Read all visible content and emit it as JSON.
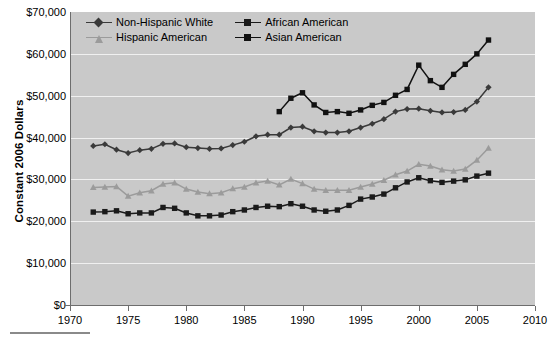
{
  "chart_data": {
    "type": "line",
    "title": "",
    "xlabel": "",
    "ylabel": "Constant 2006 Dollars",
    "xlim": [
      1970,
      2010
    ],
    "ylim": [
      0,
      70000
    ],
    "grid": true,
    "legend_position": "top-left-inside",
    "plot_background": "#c9c9c9",
    "gridline_color": "#f0f0f0",
    "xticks": [
      "1970",
      "1975",
      "1980",
      "1985",
      "1990",
      "1995",
      "2000",
      "2005",
      "2010"
    ],
    "xtick_values": [
      1970,
      1975,
      1980,
      1985,
      1990,
      1995,
      2000,
      2005,
      2010
    ],
    "yticks": [
      "$0",
      "$10,000",
      "$20,000",
      "$30,000",
      "$40,000",
      "$50,000",
      "$60,000",
      "$70,000"
    ],
    "ytick_values": [
      0,
      10000,
      20000,
      30000,
      40000,
      50000,
      60000,
      70000
    ],
    "series": [
      {
        "name": "Non-Hispanic White",
        "color": "#3a3a3a",
        "marker": "diamond",
        "x": [
          1972,
          1973,
          1974,
          1975,
          1976,
          1977,
          1978,
          1979,
          1980,
          1981,
          1982,
          1983,
          1984,
          1985,
          1986,
          1987,
          1988,
          1989,
          1990,
          1991,
          1992,
          1993,
          1994,
          1995,
          1996,
          1997,
          1998,
          1999,
          2000,
          2001,
          2002,
          2003,
          2004,
          2005,
          2006
        ],
        "values": [
          38000,
          38400,
          37100,
          36300,
          37000,
          37300,
          38500,
          38600,
          37700,
          37500,
          37300,
          37400,
          38200,
          39000,
          40300,
          40700,
          40700,
          42400,
          42600,
          41500,
          41200,
          41200,
          41500,
          42400,
          43300,
          44400,
          46200,
          46800,
          46900,
          46400,
          46000,
          46100,
          46600,
          48600,
          52000
        ]
      },
      {
        "name": "African American",
        "color": "#1a1a1a",
        "marker": "square",
        "x": [
          1972,
          1973,
          1974,
          1975,
          1976,
          1977,
          1978,
          1979,
          1980,
          1981,
          1982,
          1983,
          1984,
          1985,
          1986,
          1987,
          1988,
          1989,
          1990,
          1991,
          1992,
          1993,
          1994,
          1995,
          1996,
          1997,
          1998,
          1999,
          2000,
          2001,
          2002,
          2003,
          2004,
          2005,
          2006
        ],
        "values": [
          22200,
          22300,
          22500,
          21800,
          22000,
          22000,
          23300,
          23100,
          22000,
          21300,
          21300,
          21500,
          22300,
          22700,
          23300,
          23600,
          23500,
          24200,
          23600,
          22700,
          22400,
          22700,
          23800,
          25300,
          25800,
          26500,
          28000,
          29400,
          30400,
          29700,
          29300,
          29600,
          29900,
          30800,
          31500
        ]
      },
      {
        "name": "Hispanic American",
        "color": "#9b9b9b",
        "marker": "triangle",
        "x": [
          1972,
          1973,
          1974,
          1975,
          1976,
          1977,
          1978,
          1979,
          1980,
          1981,
          1982,
          1983,
          1984,
          1985,
          1986,
          1987,
          1988,
          1989,
          1990,
          1991,
          1992,
          1993,
          1994,
          1995,
          1996,
          1997,
          1998,
          1999,
          2000,
          2001,
          2002,
          2003,
          2004,
          2005,
          2006
        ],
        "values": [
          28100,
          28200,
          28300,
          26000,
          26800,
          27300,
          28900,
          29200,
          27700,
          27000,
          26600,
          26800,
          27800,
          28200,
          29200,
          29600,
          28700,
          30100,
          29000,
          27700,
          27400,
          27400,
          27400,
          28200,
          28900,
          29800,
          31100,
          32000,
          33600,
          33200,
          32300,
          32000,
          32500,
          34600,
          37500
        ]
      },
      {
        "name": "Asian American",
        "color": "#111111",
        "marker": "square",
        "x": [
          1988,
          1989,
          1990,
          1991,
          1992,
          1993,
          1994,
          1995,
          1996,
          1997,
          1998,
          1999,
          2000,
          2001,
          2002,
          2003,
          2004,
          2005,
          2006
        ],
        "values": [
          46200,
          49400,
          50700,
          47800,
          46000,
          46200,
          45800,
          46600,
          47700,
          48400,
          50100,
          51500,
          57300,
          53600,
          52000,
          55100,
          57500,
          60000,
          63300
        ]
      }
    ]
  },
  "legend": {
    "items": [
      {
        "label": "Non-Hispanic White",
        "marker": "diamond",
        "color": "#3a3a3a"
      },
      {
        "label": "African American",
        "marker": "square",
        "color": "#1a1a1a"
      },
      {
        "label": "Hispanic American",
        "marker": "triangle",
        "color": "#9b9b9b"
      },
      {
        "label": "Asian American",
        "marker": "square",
        "color": "#111111"
      }
    ]
  }
}
